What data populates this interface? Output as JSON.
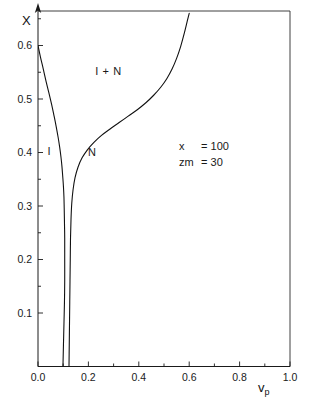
{
  "chart_data": {
    "type": "line",
    "title": "",
    "xlabel": "v_p",
    "ylabel": "X",
    "xlim": [
      0.0,
      1.0
    ],
    "ylim": [
      0.0,
      0.66
    ],
    "grid": false,
    "legend": "none",
    "x_major_ticks": [
      0.0,
      0.2,
      0.4,
      0.6,
      0.8,
      1.0
    ],
    "x_major_tick_labels": [
      "0.0",
      "0.2",
      "0.4",
      "0.6",
      "0.8",
      "1.0"
    ],
    "x_minor_ticks": [
      0.1,
      0.3,
      0.5,
      0.7,
      0.9
    ],
    "y_major_ticks": [
      0.1,
      0.2,
      0.3,
      0.4,
      0.5,
      0.6
    ],
    "y_major_tick_labels": [
      "0.1",
      "0.2",
      "0.3",
      "0.4",
      "0.5",
      "0.6"
    ],
    "y_minor_ticks": [
      0.15,
      0.25,
      0.35,
      0.45,
      0.55,
      0.65
    ],
    "series": [
      {
        "name": "I-boundary",
        "points": [
          [
            0.0,
            0.6
          ],
          [
            0.01,
            0.578
          ],
          [
            0.021,
            0.556
          ],
          [
            0.032,
            0.533
          ],
          [
            0.043,
            0.512
          ],
          [
            0.054,
            0.49
          ],
          [
            0.063,
            0.47
          ],
          [
            0.072,
            0.449
          ],
          [
            0.08,
            0.428
          ],
          [
            0.086,
            0.41
          ],
          [
            0.091,
            0.392
          ],
          [
            0.095,
            0.374
          ],
          [
            0.098,
            0.356
          ],
          [
            0.101,
            0.336
          ],
          [
            0.103,
            0.316
          ],
          [
            0.104,
            0.296
          ],
          [
            0.105,
            0.27
          ],
          [
            0.106,
            0.24
          ],
          [
            0.106,
            0.2
          ],
          [
            0.106,
            0.16
          ],
          [
            0.105,
            0.12
          ],
          [
            0.103,
            0.08
          ],
          [
            0.101,
            0.04
          ],
          [
            0.099,
            0.0
          ]
        ]
      },
      {
        "name": "N-boundary",
        "points": [
          [
            0.123,
            0.0
          ],
          [
            0.124,
            0.04
          ],
          [
            0.125,
            0.08
          ],
          [
            0.126,
            0.12
          ],
          [
            0.127,
            0.16
          ],
          [
            0.128,
            0.2
          ],
          [
            0.129,
            0.24
          ],
          [
            0.131,
            0.275
          ],
          [
            0.134,
            0.305
          ],
          [
            0.139,
            0.33
          ],
          [
            0.147,
            0.353
          ],
          [
            0.159,
            0.373
          ],
          [
            0.175,
            0.39
          ],
          [
            0.196,
            0.405
          ],
          [
            0.222,
            0.419
          ],
          [
            0.252,
            0.432
          ],
          [
            0.286,
            0.444
          ],
          [
            0.322,
            0.456
          ],
          [
            0.358,
            0.468
          ],
          [
            0.394,
            0.48
          ],
          [
            0.428,
            0.493
          ],
          [
            0.459,
            0.507
          ],
          [
            0.487,
            0.522
          ],
          [
            0.511,
            0.538
          ],
          [
            0.532,
            0.556
          ],
          [
            0.55,
            0.576
          ],
          [
            0.566,
            0.598
          ],
          [
            0.58,
            0.622
          ],
          [
            0.592,
            0.645
          ],
          [
            0.6,
            0.66
          ]
        ]
      }
    ],
    "region_labels": [
      {
        "text": "I + N",
        "x": 0.28,
        "y": 0.545
      },
      {
        "text": "I",
        "x": 0.045,
        "y": 0.395
      },
      {
        "text": "N",
        "x": 0.215,
        "y": 0.393
      }
    ],
    "annotations": [
      {
        "label": "x",
        "equals": "= 100",
        "x": 0.56,
        "y": 0.405
      },
      {
        "label": "zm",
        "equals": "= 30",
        "x": 0.56,
        "y": 0.375
      }
    ],
    "colors": {
      "curve": "#111111",
      "axis": "#1a1a1a",
      "background": "#ffffff"
    }
  }
}
